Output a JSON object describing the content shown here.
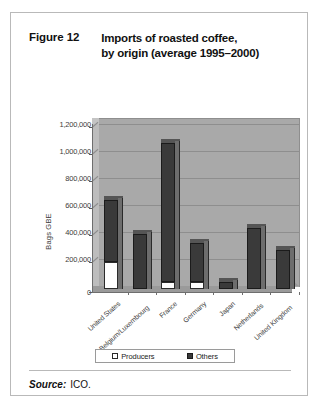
{
  "figure": {
    "number": "Figure 12",
    "title_line1": "Imports of roasted coffee,",
    "title_line2": "by origin (average 1995–2000)"
  },
  "source": {
    "label": "Source:",
    "value": "ICO."
  },
  "colors": {
    "plot_background": "#a9a9a9",
    "others_fill": "#3a3a3a",
    "producers_fill": "#ffffff",
    "gridline": "#8e8e8e",
    "frame_border": "#b9b9b9",
    "text": "#3c3c3c"
  },
  "chart_data": {
    "type": "bar",
    "stacked": true,
    "title": "Imports of roasted coffee, by origin (average 1995–2000)",
    "xlabel": "",
    "ylabel": "Bags GBE",
    "ylim": [
      0,
      1200000
    ],
    "ytick_values": [
      0,
      200000,
      400000,
      600000,
      800000,
      1000000,
      1200000
    ],
    "ytick_labels": [
      "0",
      "200,000",
      "400,000",
      "600,000",
      "800,000",
      "1,000,000",
      "1,200,000"
    ],
    "grid": true,
    "legend_position": "bottom",
    "categories": [
      "United States",
      "Belgium/Luxembourg",
      "France",
      "Germany",
      "Japan",
      "Netherlands",
      "United Kingdom"
    ],
    "series": [
      {
        "name": "Producers",
        "values": [
          200000,
          0,
          50000,
          55000,
          0,
          0,
          0
        ]
      },
      {
        "name": "Others",
        "values": [
          460000,
          405000,
          1030000,
          285000,
          55000,
          455000,
          290000
        ]
      }
    ],
    "totals": [
      660000,
      405000,
      1080000,
      340000,
      55000,
      455000,
      290000
    ]
  }
}
